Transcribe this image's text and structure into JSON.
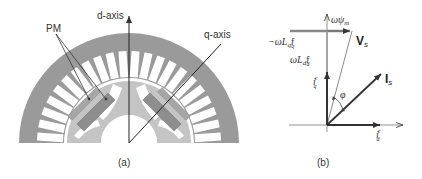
{
  "figure_a": {
    "caption": "(a)",
    "labels": {
      "d_axis": "d-axis",
      "q_axis": "q-axis",
      "pm": "PM"
    },
    "stator_slots": 22,
    "colors": {
      "stator": "#9a9a9a",
      "rotor": "#c4c4c4",
      "magnet": "#8e8e8e",
      "slot": "#ffffff",
      "axis_line": "#222222"
    }
  },
  "figure_b": {
    "caption": "(b)",
    "labels": {
      "omega_psi_m": "ωψ",
      "omega_psi_m_sub": "m",
      "neg_omega_lq_iq": "−ωL",
      "neg_omega_lq_iq_sub1": "q",
      "neg_omega_lq_iq_var": "i",
      "neg_omega_lq_iq_sup": "e",
      "neg_omega_lq_iq_sub2": "q",
      "omega_ld_id": "ωL",
      "omega_ld_id_sub1": "d",
      "omega_ld_id_var": "i",
      "omega_ld_id_sup": "e",
      "omega_ld_id_sub2": "d",
      "iq": "i",
      "iq_sup": "e",
      "iq_sub": "q",
      "id": "i",
      "id_sup": "e",
      "id_sub": "d",
      "vs": "V",
      "vs_sub": "s",
      "is": "I",
      "is_sub": "s",
      "phi": "φ"
    }
  }
}
